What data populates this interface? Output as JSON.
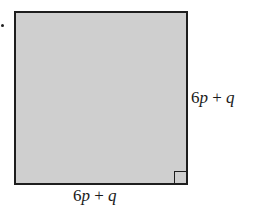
{
  "diagram": {
    "shape": "square",
    "fill_color": "#cfcfcf",
    "stroke_color": "#1e1e1e",
    "right_angle_marker": "bottom-right",
    "side_right_label": "6p + q",
    "side_bottom_label": "6p + q",
    "labels": {
      "right": {
        "coef": "6",
        "var1": "p",
        "op": " + ",
        "var2": "q"
      },
      "bottom": {
        "coef": "6",
        "var1": "p",
        "op": " + ",
        "var2": "q"
      }
    }
  }
}
